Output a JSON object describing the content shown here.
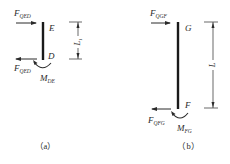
{
  "panels": [
    {
      "id": "a",
      "caption": "（a）",
      "top_force": {
        "main": "F",
        "sub": "QED"
      },
      "bottom_force": {
        "main": "F",
        "sub": "QED"
      },
      "moment": {
        "main": "M",
        "sub": "DE"
      },
      "top_node": "E",
      "bottom_node": "D",
      "dimension": {
        "main": "L",
        "sub": "1"
      }
    },
    {
      "id": "b",
      "caption": "（b）",
      "top_force": {
        "main": "F",
        "sub": "QGF"
      },
      "bottom_force": {
        "main": "F",
        "sub": "QFG"
      },
      "moment": {
        "main": "M",
        "sub": "FG"
      },
      "top_node": "G",
      "bottom_node": "F",
      "dimension": {
        "main": "L",
        "sub": ""
      }
    }
  ],
  "colors": {
    "ink": "#2a2a2a",
    "background": "#ffffff"
  }
}
